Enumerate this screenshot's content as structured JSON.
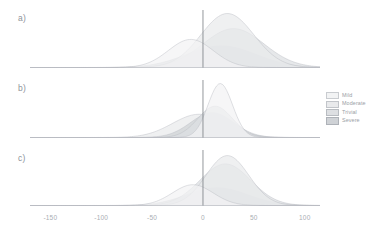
{
  "figure": {
    "background": "#ffffff",
    "panels": [
      {
        "label": "a)",
        "name": "panel-a"
      },
      {
        "label": "b)",
        "name": "panel-b"
      },
      {
        "label": "c)",
        "name": "panel-c"
      }
    ]
  },
  "legend": {
    "position": "right",
    "items": [
      {
        "label": "Mild",
        "fill": "#f2f3f4",
        "stroke": "#c9ccd0"
      },
      {
        "label": "Moderate",
        "fill": "#e9eaec",
        "stroke": "#c2c5ca"
      },
      {
        "label": "Trivial",
        "fill": "#dddfe2",
        "stroke": "#b8bcc1"
      },
      {
        "label": "Severe",
        "fill": "#cfd2d6",
        "stroke": "#aeb2b8"
      }
    ]
  },
  "axis": {
    "tick_labels": [
      "-150",
      "-100",
      "-50",
      "0",
      "50",
      "100"
    ],
    "tick_values": [
      -150,
      -100,
      -50,
      0,
      50,
      100
    ],
    "xlim": [
      -170,
      115
    ],
    "reference_line": 0
  },
  "chart_data": {
    "type": "area",
    "title": "",
    "subtitle": "",
    "xlabel": "",
    "ylabel": "",
    "xlim": [
      -170,
      115
    ],
    "grid": false,
    "legend_position": "right",
    "reference_line_x": 0,
    "panels": [
      {
        "label": "a)",
        "series": [
          {
            "name": "Mild",
            "mean": -12,
            "sd": 22,
            "peak_height": 0.52,
            "color": "#f2f3f4"
          },
          {
            "name": "Moderate",
            "mean": 24,
            "sd": 26,
            "peak_height": 1.0,
            "color": "#e9eaec"
          },
          {
            "name": "Trivial",
            "mean": 30,
            "sd": 30,
            "peak_height": 0.72,
            "color": "#dddfe2"
          },
          {
            "name": "Severe",
            "mean": 18,
            "sd": 34,
            "peak_height": 0.4,
            "color": "#cfd2d6"
          }
        ]
      },
      {
        "label": "b)",
        "series": [
          {
            "name": "Mild",
            "mean": 17,
            "sd": 12,
            "peak_height": 1.0,
            "color": "#f2f3f4"
          },
          {
            "name": "Moderate",
            "mean": -4,
            "sd": 26,
            "peak_height": 0.43,
            "color": "#e9eaec"
          },
          {
            "name": "Trivial",
            "mean": 12,
            "sd": 17,
            "peak_height": 0.58,
            "color": "#dddfe2"
          },
          {
            "name": "Severe",
            "mean": 9,
            "sd": 21,
            "peak_height": 0.46,
            "color": "#cfd2d6"
          }
        ]
      },
      {
        "label": "c)",
        "series": [
          {
            "name": "Mild",
            "mean": -10,
            "sd": 20,
            "peak_height": 0.4,
            "color": "#f2f3f4"
          },
          {
            "name": "Moderate",
            "mean": 24,
            "sd": 21,
            "peak_height": 0.96,
            "color": "#e9eaec"
          },
          {
            "name": "Trivial",
            "mean": 22,
            "sd": 25,
            "peak_height": 0.8,
            "color": "#dddfe2"
          },
          {
            "name": "Severe",
            "mean": 14,
            "sd": 30,
            "peak_height": 0.34,
            "color": "#cfd2d6"
          }
        ]
      }
    ]
  }
}
